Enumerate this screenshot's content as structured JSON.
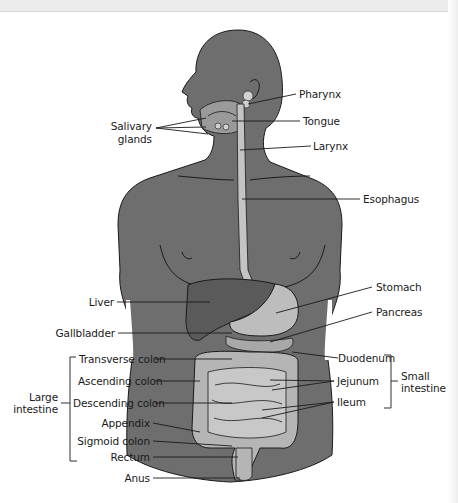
{
  "diagram": {
    "colors": {
      "body": "#6e6e6e",
      "organ_dark": "#5a5a5a",
      "organ_light": "#bdbdbd",
      "outline": "#1a1a1a",
      "label_text": "#1a1a1a"
    },
    "labels": {
      "salivary_glands": [
        "Salivary",
        "glands"
      ],
      "pharynx": "Pharynx",
      "tongue": "Tongue",
      "larynx": "Larynx",
      "esophagus": "Esophagus",
      "liver": "Liver",
      "stomach": "Stomach",
      "pancreas": "Pancreas",
      "gallbladder": "Gallbladder",
      "transverse_colon": "Transverse colon",
      "ascending_colon": "Ascending colon",
      "descending_colon": "Descending colon",
      "appendix": "Appendix",
      "sigmoid_colon": "Sigmoid colon",
      "rectum": "Rectum",
      "anus": "Anus",
      "duodenum": "Duodenum",
      "jejunum": "Jejunum",
      "ileum": "Ileum"
    },
    "groups": {
      "large_intestine": [
        "Large",
        "intestine"
      ],
      "small_intestine": [
        "Small",
        "intestine"
      ]
    }
  }
}
